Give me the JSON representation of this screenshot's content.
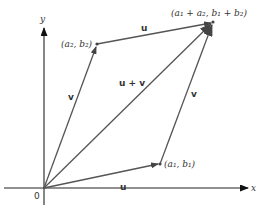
{
  "figure": {
    "axes": {
      "x_label": "x",
      "y_label": "y",
      "origin_label": "0"
    },
    "points": [
      {
        "id": "p1",
        "label": "(a₁, b₁)"
      },
      {
        "id": "p2",
        "label": "(a₂, b₂)"
      },
      {
        "id": "sum",
        "label": "(a₁ + a₂, b₁ + b₂)"
      }
    ],
    "vectors": [
      {
        "id": "u-from-origin",
        "label": "u"
      },
      {
        "id": "v-from-origin",
        "label": "v"
      },
      {
        "id": "u-plus-v",
        "label": "u + v"
      },
      {
        "id": "u-from-p2",
        "label": "u"
      },
      {
        "id": "v-from-p1",
        "label": "v"
      }
    ],
    "colors": {
      "axis": "#222222",
      "vector": "#555555",
      "text": "#333333"
    }
  }
}
